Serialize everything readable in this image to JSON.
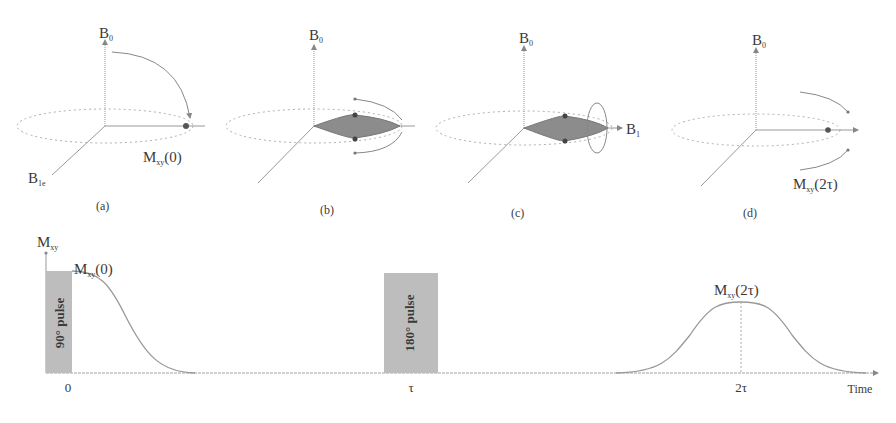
{
  "panels": [
    {
      "id": "a",
      "caption": "(a)",
      "axis_z": "B",
      "axis_z_sub": "0",
      "axis_x_label": "B",
      "axis_x_sub": "1e",
      "vector_label": "M",
      "vector_sub": "xy",
      "vector_arg": "(0)"
    },
    {
      "id": "b",
      "caption": "(b)",
      "axis_z": "B",
      "axis_z_sub": "0"
    },
    {
      "id": "c",
      "caption": "(c)",
      "axis_z": "B",
      "axis_z_sub": "0",
      "axis_y_label": "B",
      "axis_y_sub": "1"
    },
    {
      "id": "d",
      "caption": "(d)",
      "axis_z": "B",
      "axis_z_sub": "0",
      "vector_label": "M",
      "vector_sub": "xy",
      "vector_arg": "(2τ)"
    }
  ],
  "timing": {
    "y_axis_label": "M",
    "y_axis_sub": "xy",
    "pulse1_label": "90° pulse",
    "pulse2_label": "180° pulse",
    "fid_label": "M",
    "fid_sub": "xy",
    "fid_arg": "(0)",
    "echo_label": "M",
    "echo_sub": "xy",
    "echo_arg": "(2τ)",
    "tick_0": "0",
    "tick_tau": "τ",
    "tick_2tau": "2τ",
    "x_axis_label": "Time"
  },
  "colors": {
    "line": "#9a9a9a",
    "pulse_fill": "#bdbdbd",
    "fan_fill": "#8c8c8c",
    "text": "#3a3a3a"
  }
}
